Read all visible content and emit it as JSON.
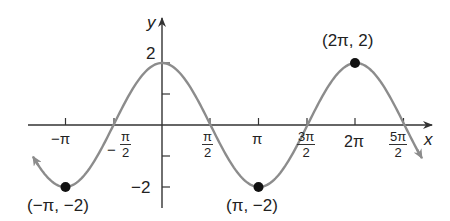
{
  "chart_data": {
    "type": "line",
    "function": "y = 2cos(x)",
    "title": "",
    "xlabel": "x",
    "ylabel": "y",
    "xlim": [
      -1.32,
      2.7
    ],
    "xlim_units": "multiples of pi",
    "ylim": [
      -2.6,
      3.3
    ],
    "grid": false,
    "legend": null,
    "x_ticks": [
      {
        "value": -1.0,
        "label": "−π"
      },
      {
        "value": -0.5,
        "label_num": "π",
        "label_den": "2",
        "label_sign": "−"
      },
      {
        "value": 0.5,
        "label_num": "π",
        "label_den": "2"
      },
      {
        "value": 1.0,
        "label": "π"
      },
      {
        "value": 1.5,
        "label_num": "3π",
        "label_den": "2"
      },
      {
        "value": 2.0,
        "label": "2π"
      },
      {
        "value": 2.5,
        "label_num": "5π",
        "label_den": "2"
      }
    ],
    "y_ticks": [
      {
        "value": 2,
        "label": "2"
      },
      {
        "value": 1,
        "label": ""
      },
      {
        "value": -1,
        "label": ""
      },
      {
        "value": -2,
        "label": "−2"
      }
    ],
    "labeled_points": [
      {
        "x": -1.0,
        "y": -2,
        "label": "(−π, −2)"
      },
      {
        "x": 1.0,
        "y": -2,
        "label": "(π, −2)"
      },
      {
        "x": 2.0,
        "y": 2,
        "label": "(2π, 2)"
      }
    ],
    "colors": {
      "curve": "#8c8c8c",
      "axes": "#333333",
      "points": "#111111"
    }
  },
  "labels": {
    "x_axis": "x",
    "y_axis": "y",
    "y_tick_2": "2",
    "y_tick_neg2": "−2",
    "x_tick_neg_pi": "−π",
    "x_tick_neg_pi_half_sign": "−",
    "x_tick_neg_pi_half_num": "π",
    "x_tick_neg_pi_half_den": "2",
    "x_tick_pi_half_num": "π",
    "x_tick_pi_half_den": "2",
    "x_tick_pi": "π",
    "x_tick_3pi_half_num": "3π",
    "x_tick_3pi_half_den": "2",
    "x_tick_2pi": "2π",
    "x_tick_5pi_half_num": "5π",
    "x_tick_5pi_half_den": "2",
    "point_neg_pi": "(−π, −2)",
    "point_pi": "(π, −2)",
    "point_2pi": "(2π, 2)"
  }
}
